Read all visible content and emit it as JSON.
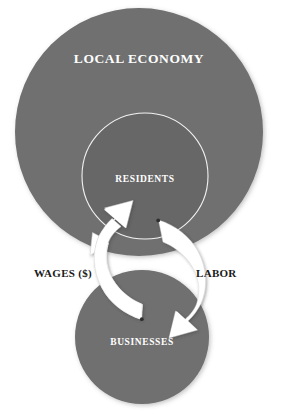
{
  "diagram": {
    "title": "LOCAL ECONOMY",
    "type": "nested-circle-flow-diagram",
    "background_color": "#ffffff",
    "nodes": [
      {
        "id": "local-economy",
        "label": "LOCAL ECONOMY",
        "shape": "circle",
        "fill_color": "#6f6f6f",
        "label_color": "#ffffff",
        "cx": 139,
        "cy": 132,
        "r": 124
      },
      {
        "id": "residents",
        "label": "RESIDENTS",
        "shape": "circle",
        "fill_color": "#676767",
        "stroke_color": "#f2f2f2",
        "label_color": "#ffffff",
        "cx": 145,
        "cy": 176,
        "r": 63
      },
      {
        "id": "businesses",
        "label": "BUSINESSES",
        "shape": "circle",
        "fill_color": "#6f6f6f",
        "label_color": "#ffffff",
        "cx": 142,
        "cy": 337,
        "r": 67
      }
    ],
    "flows": [
      {
        "id": "wages",
        "label": "WAGES ($)",
        "label_color": "#1a1a1a",
        "from": "businesses",
        "to": "residents",
        "direction": "up",
        "arrow_color": "#ffffff"
      },
      {
        "id": "labor",
        "label": "LABOR",
        "label_color": "#1a1a1a",
        "from": "residents",
        "to": "businesses",
        "direction": "down",
        "arrow_color": "#ffffff"
      }
    ]
  }
}
